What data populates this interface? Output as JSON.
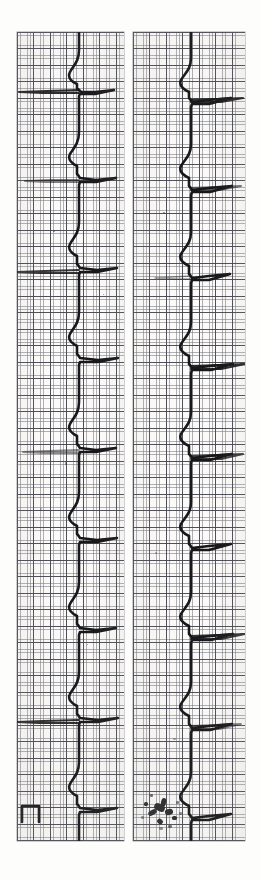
{
  "document": {
    "kind": "ecg-rhythm-strip-scan",
    "title": "Electrocardiogram rhythm strip",
    "orientation": "rotated-90-clockwise",
    "background_color": "#fdfdfc",
    "paper_color": "#fbfaf8",
    "trace_color": "#18181a",
    "grid_fine_color": "#787a82",
    "grid_bold_color": "#464850",
    "edge_label": "S"
  },
  "layout": {
    "width": 261,
    "height": 880,
    "panels": [
      {
        "id": "strip-left",
        "left": 17,
        "top": 32,
        "width": 107,
        "height": 809
      },
      {
        "id": "strip-right",
        "left": 133,
        "top": 32,
        "width": 112,
        "height": 809
      }
    ],
    "gutter_px": 9
  },
  "chart_data": {
    "type": "line",
    "xlabel": "Time (s) — runs top to bottom",
    "ylabel": "Amplitude (mV) — deflects to the right",
    "paper_speed_mm_per_s": 25,
    "gain_mm_per_mV": 10,
    "grid": {
      "small_square_px": 3.3,
      "large_square_px": 16.5,
      "small_square_time_s": 0.04,
      "large_square_time_s": 0.2,
      "small_square_mV": 0.1,
      "large_square_mV": 0.5,
      "visible": true
    },
    "calibration_pulse": {
      "present": true,
      "amplitude_mV": 1.0,
      "width_s": 0.2,
      "panel": "strip-left",
      "position_px": {
        "x": 22,
        "y": 806
      }
    },
    "annotations": [
      {
        "label": "ink smudge artifact",
        "panel": "strip-right",
        "x": 152,
        "y": 806
      },
      {
        "label": "baseline wander",
        "panel": "strip-left",
        "x": 20,
        "y": 155
      }
    ],
    "series": [
      {
        "name": "strip-left",
        "lead": "II",
        "baseline_x_px": 77,
        "beats": [
          {
            "index": 1,
            "r_peak_y_px": 60,
            "r_amplitude_px": 44,
            "rr_interval_px": 0
          },
          {
            "index": 2,
            "r_peak_y_px": 148,
            "r_amplitude_px": 42,
            "rr_interval_px": 88
          },
          {
            "index": 3,
            "r_peak_y_px": 238,
            "r_amplitude_px": 43,
            "rr_interval_px": 90
          },
          {
            "index": 4,
            "r_peak_y_px": 328,
            "r_amplitude_px": 45,
            "rr_interval_px": 90
          },
          {
            "index": 5,
            "r_peak_y_px": 418,
            "r_amplitude_px": 43,
            "rr_interval_px": 90
          },
          {
            "index": 6,
            "r_peak_y_px": 508,
            "r_amplitude_px": 44,
            "rr_interval_px": 90
          },
          {
            "index": 7,
            "r_peak_y_px": 598,
            "r_amplitude_px": 42,
            "rr_interval_px": 90
          },
          {
            "index": 8,
            "r_peak_y_px": 688,
            "r_amplitude_px": 45,
            "rr_interval_px": 90
          },
          {
            "index": 9,
            "r_peak_y_px": 778,
            "r_amplitude_px": 44,
            "rr_interval_px": 90
          }
        ]
      },
      {
        "name": "strip-right",
        "lead": "II (continued)",
        "baseline_x_px": 190,
        "beats": [
          {
            "index": 1,
            "r_peak_y_px": 68,
            "r_amplitude_px": 46,
            "rr_interval_px": 0
          },
          {
            "index": 2,
            "r_peak_y_px": 158,
            "r_amplitude_px": 45,
            "rr_interval_px": 90
          },
          {
            "index": 3,
            "r_peak_y_px": 248,
            "r_amplitude_px": 44,
            "rr_interval_px": 90
          },
          {
            "index": 4,
            "r_peak_y_px": 338,
            "r_amplitude_px": 46,
            "rr_interval_px": 90
          },
          {
            "index": 5,
            "r_peak_y_px": 428,
            "r_amplitude_px": 45,
            "rr_interval_px": 90
          },
          {
            "index": 6,
            "r_peak_y_px": 518,
            "r_amplitude_px": 44,
            "rr_interval_px": 90
          },
          {
            "index": 7,
            "r_peak_y_px": 608,
            "r_amplitude_px": 46,
            "rr_interval_px": 90
          },
          {
            "index": 8,
            "r_peak_y_px": 698,
            "r_amplitude_px": 45,
            "rr_interval_px": 90
          },
          {
            "index": 9,
            "r_peak_y_px": 788,
            "r_amplitude_px": 44,
            "rr_interval_px": 90
          }
        ]
      }
    ],
    "measurements": {
      "rate_bpm": 67,
      "rhythm": "regular sinus rhythm"
    }
  }
}
